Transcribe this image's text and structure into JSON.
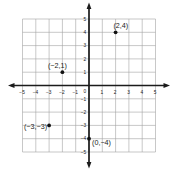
{
  "figure": {
    "background": "#ffffff",
    "grid_color": "#a3a3a3",
    "axis_color": "#1b1b1b",
    "point_color": "#111111",
    "text_color": "#1b1b1b"
  },
  "chart_data": {
    "type": "scatter",
    "title": "",
    "xlabel": "",
    "ylabel": "",
    "xlim": [
      -5,
      5
    ],
    "ylim": [
      -5,
      5
    ],
    "grid": true,
    "legend": "none",
    "x_ticks": {
      "values": [
        -5,
        -4,
        -3,
        -2,
        -1,
        1,
        2,
        3,
        4,
        5
      ],
      "labels": [
        "−5",
        "−4",
        "−3",
        "−2",
        "−1",
        "1",
        "2",
        "3",
        "4",
        "5"
      ]
    },
    "y_ticks": {
      "values": [
        5,
        4,
        3,
        2,
        1,
        -1,
        -2,
        -3,
        -4,
        -5
      ],
      "labels": [
        "5",
        "4",
        "3",
        "2",
        "1",
        "−1",
        "−2",
        "−3",
        "−4",
        "−5"
      ]
    },
    "origin_label": "0",
    "points": [
      {
        "x": 2,
        "y": 4,
        "label": "(2,4)",
        "label_position": "above-right"
      },
      {
        "x": -2,
        "y": 1,
        "label": "(−2,1)",
        "label_position": "above-left"
      },
      {
        "x": -3,
        "y": -3,
        "label": "(−3,−3)",
        "label_position": "below-left"
      },
      {
        "x": 0,
        "y": -4,
        "label": "(0,−4)",
        "label_position": "below-right"
      }
    ]
  }
}
